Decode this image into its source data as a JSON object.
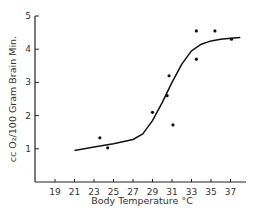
{
  "chart_data": {
    "type": "scatter",
    "title": "",
    "xlabel": "Body Temperature °C",
    "ylabel": "cc O₂/100 Gram Brain Min.",
    "xlim": [
      17,
      38.5
    ],
    "ylim": [
      0,
      5
    ],
    "x_ticks": [
      19,
      21,
      23,
      25,
      27,
      29,
      31,
      33,
      35,
      37
    ],
    "y_ticks": [
      1,
      2,
      3,
      4,
      5
    ],
    "grid": false,
    "legend": null,
    "series": [
      {
        "name": "observations",
        "kind": "scatter",
        "points": [
          {
            "x": 23.6,
            "y": 1.33
          },
          {
            "x": 24.4,
            "y": 1.03
          },
          {
            "x": 29.0,
            "y": 2.1
          },
          {
            "x": 30.5,
            "y": 2.6
          },
          {
            "x": 30.7,
            "y": 3.2
          },
          {
            "x": 31.1,
            "y": 1.72
          },
          {
            "x": 33.5,
            "y": 3.7
          },
          {
            "x": 33.5,
            "y": 4.55
          },
          {
            "x": 35.4,
            "y": 4.55
          },
          {
            "x": 37.1,
            "y": 4.3
          }
        ]
      },
      {
        "name": "fitted curve",
        "kind": "line",
        "points": [
          {
            "x": 21.0,
            "y": 0.95
          },
          {
            "x": 23.0,
            "y": 1.05
          },
          {
            "x": 25.0,
            "y": 1.15
          },
          {
            "x": 27.0,
            "y": 1.28
          },
          {
            "x": 28.0,
            "y": 1.45
          },
          {
            "x": 29.0,
            "y": 1.85
          },
          {
            "x": 30.0,
            "y": 2.4
          },
          {
            "x": 31.0,
            "y": 3.0
          },
          {
            "x": 32.0,
            "y": 3.55
          },
          {
            "x": 33.0,
            "y": 3.95
          },
          {
            "x": 34.0,
            "y": 4.15
          },
          {
            "x": 35.0,
            "y": 4.25
          },
          {
            "x": 36.0,
            "y": 4.3
          },
          {
            "x": 37.0,
            "y": 4.33
          },
          {
            "x": 38.0,
            "y": 4.35
          }
        ]
      }
    ]
  }
}
